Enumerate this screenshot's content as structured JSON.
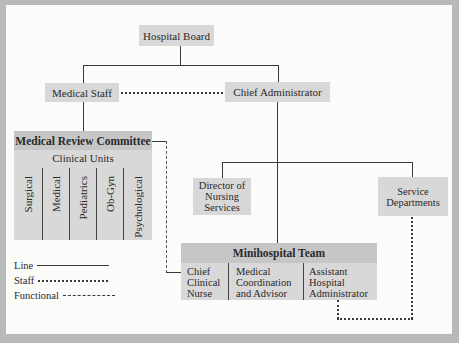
{
  "chart": {
    "hospital_board": "Hospital Board",
    "medical_staff": "Medical Staff",
    "chief_administrator": "Chief Administrator",
    "medical_review_committee": {
      "title": "Medical Review Committee",
      "subtitle": "Clinical Units",
      "units": [
        "Surgical",
        "Medical",
        "Pediatrics",
        "Ob-Gyn",
        "Psychological"
      ]
    },
    "director_nursing": "Director of\nNursing\nServices",
    "service_departments": "Service\nDepartments",
    "minihospital_team": {
      "title": "Minihospital Team",
      "members": [
        "Chief\nClinical\nNurse",
        "Medical\nCoordination\nand Advisor",
        "Assistant\nHospital\nAdministrator"
      ]
    }
  },
  "legend": {
    "line": "Line",
    "staff": "Staff",
    "functional": "Functional"
  },
  "colors": {
    "box": "#d8d8d8",
    "header": "#c6c6c6",
    "frame": "#b9b9b9",
    "background": "#fbfbfa"
  }
}
